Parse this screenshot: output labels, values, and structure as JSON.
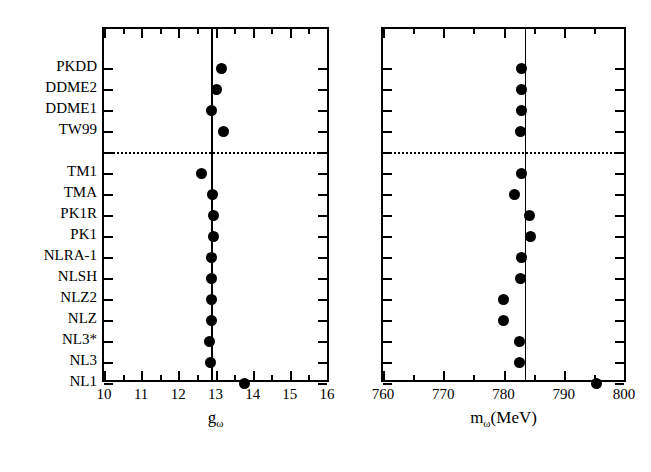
{
  "chart_data": {
    "type": "scatter",
    "title": "",
    "panels": [
      {
        "id": "left",
        "xlabel": "g_ω",
        "xlabel_base": "g",
        "xlabel_sub": "ω",
        "xlim": [
          10,
          16
        ],
        "xticks": [
          10,
          11,
          12,
          13,
          14,
          15,
          16
        ],
        "xticklabels": [
          "10",
          "11",
          "12",
          "13",
          "14",
          "15",
          "16"
        ],
        "xminorticks": [
          10.5,
          11.5,
          12.5,
          13.5,
          14.5,
          15.5
        ],
        "reference_line": 12.89,
        "grid": false,
        "values": [
          13.15,
          13.04,
          12.89,
          13.22,
          12.62,
          12.91,
          12.95,
          12.94,
          12.89,
          12.89,
          12.89,
          12.9,
          12.84,
          12.87,
          13.79
        ]
      },
      {
        "id": "right",
        "xlabel": "m_ω(MeV)",
        "xlabel_base": "m",
        "xlabel_sub": "ω",
        "xlabel_tail": "(MeV)",
        "xlim": [
          760,
          800
        ],
        "xticks": [
          760,
          770,
          780,
          790,
          800
        ],
        "xticklabels": [
          "760",
          "770",
          "780",
          "790",
          "800"
        ],
        "xminorticks": [
          765,
          775,
          785,
          795
        ],
        "reference_line": 783.5,
        "grid": false,
        "values": [
          783.0,
          783.0,
          783.0,
          782.8,
          783.0,
          781.8,
          784.3,
          784.5,
          783.0,
          782.9,
          780.0,
          780.0,
          782.6,
          782.6,
          795.5
        ]
      }
    ],
    "categories": [
      "PKDD",
      "DDME2",
      "DDME1",
      "TW99",
      "",
      "TM1",
      "TMA",
      "PK1R",
      "PK1",
      "NLRA-1",
      "NLSH",
      "NLZ2",
      "NLZ",
      "NL3*",
      "NL3",
      "NL1"
    ],
    "ylabels": [
      "PKDD",
      "DDME2",
      "DDME1",
      "TW99",
      "TM1",
      "TMA",
      "PK1R",
      "PK1",
      "NLRA-1",
      "NLSH",
      "NLZ2",
      "NLZ",
      "NL3*",
      "NL3",
      "NL1"
    ],
    "separator_after": "TW99",
    "separator_style": "dotted",
    "marker": "filled-circle",
    "marker_color": "#000000",
    "legend": "none",
    "ylim_note": "categorical rows, top to bottom"
  }
}
